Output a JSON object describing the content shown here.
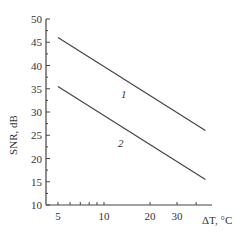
{
  "chart_data": {
    "type": "line",
    "title": "",
    "xlabel": "ΔT, °C",
    "ylabel": "SNR, dB",
    "xscale": "log",
    "xlim": [
      4.3,
      48
    ],
    "ylim": [
      10,
      50
    ],
    "xticks": [
      5,
      10,
      20,
      30
    ],
    "yticks": [
      10,
      15,
      20,
      25,
      30,
      35,
      40,
      45,
      50
    ],
    "grid": false,
    "series": [
      {
        "name": "1",
        "x": [
          5,
          46
        ],
        "values": [
          46,
          26
        ]
      },
      {
        "name": "2",
        "x": [
          5,
          46
        ],
        "values": [
          35.5,
          15.5
        ]
      }
    ],
    "annotations": [
      "1",
      "2"
    ]
  },
  "labels": {
    "ylabel": "SNR, dB",
    "xlabel": "ΔT, °C",
    "s1": "1",
    "s2": "2"
  }
}
